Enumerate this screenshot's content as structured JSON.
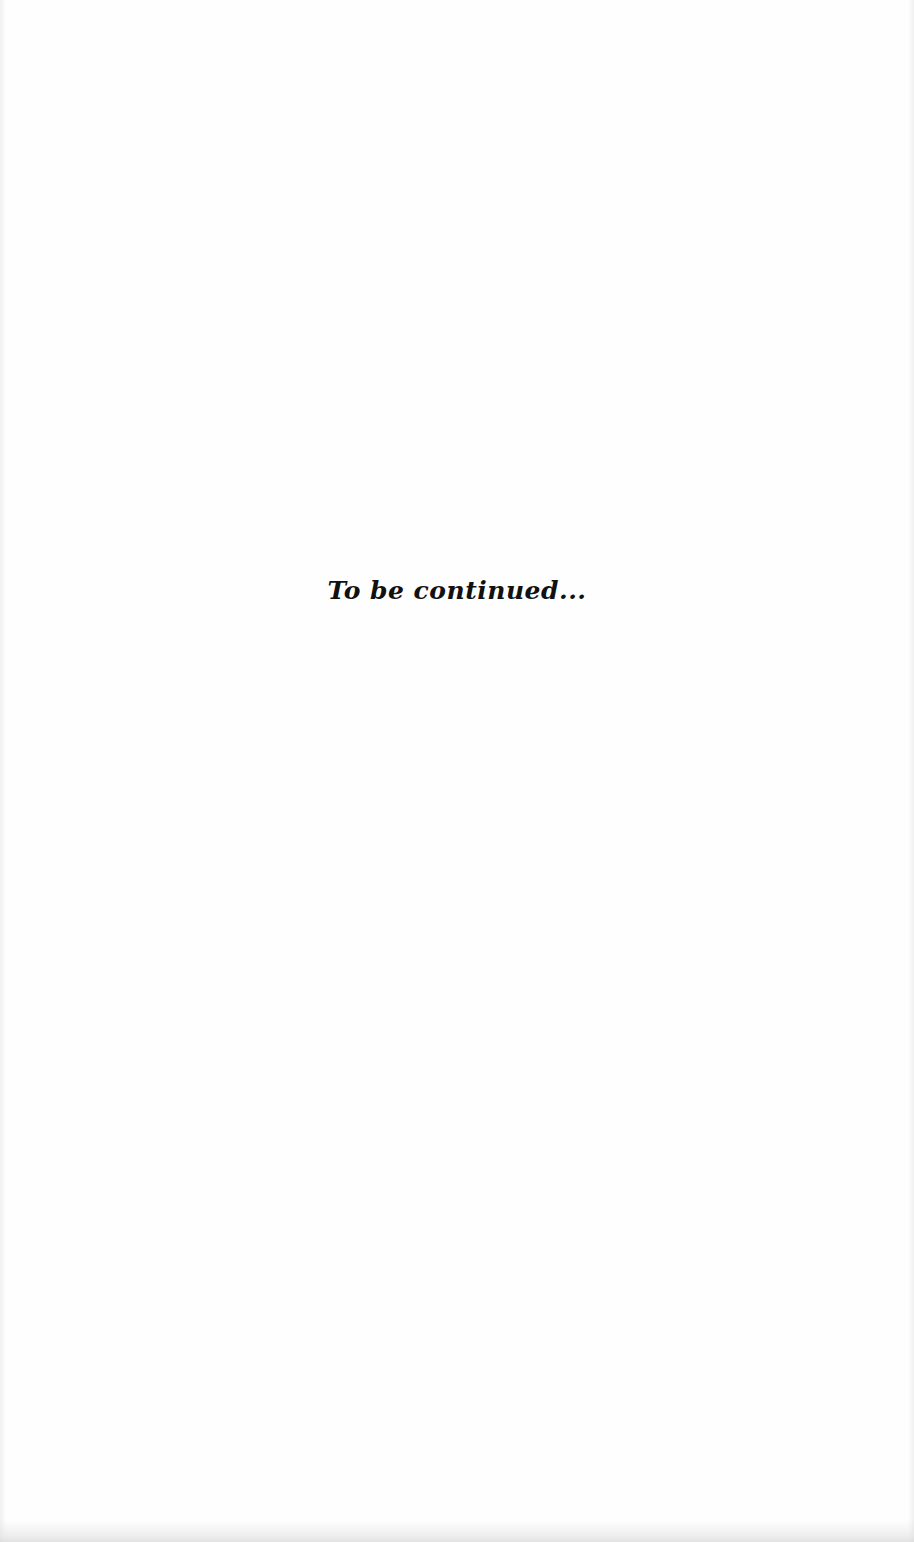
{
  "page": {
    "closing_text": "To be continued...",
    "background_color": "#ffffff",
    "text_color": "#111111"
  }
}
